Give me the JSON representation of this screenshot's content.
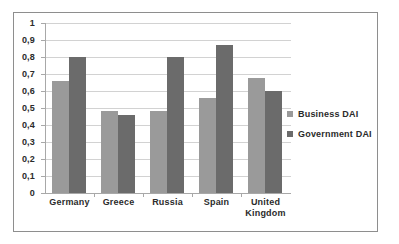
{
  "chart_data": {
    "type": "bar",
    "title": "",
    "subtitle": "",
    "xlabel": "",
    "ylabel": "",
    "categories": [
      "Germany",
      "Greece",
      "Russia",
      "Spain",
      "United Kingdom"
    ],
    "series": [
      {
        "name": "Business DAI",
        "color": "#9a9a9a",
        "values": [
          0.66,
          0.48,
          0.48,
          0.56,
          0.675
        ]
      },
      {
        "name": "Government DAI",
        "color": "#6b6b6b",
        "values": [
          0.8,
          0.46,
          0.8,
          0.87,
          0.6
        ]
      }
    ],
    "ylim": [
      0,
      1
    ],
    "ytick_values": [
      0,
      0.1,
      0.2,
      0.3,
      0.4,
      0.5,
      0.6,
      0.7,
      0.8,
      0.9,
      1
    ],
    "ytick_labels": [
      "0",
      "0,1",
      "0,2",
      "0,3",
      "0,4",
      "0,5",
      "0,6",
      "0,7",
      "0,8",
      "0,9",
      "1"
    ],
    "grid": true,
    "legend_position": "right",
    "decimal_separator": ","
  },
  "legend": {
    "entries": [
      {
        "label": "Business DAI",
        "marker": "legend-swatch-business"
      },
      {
        "label": "Government DAI",
        "marker": "legend-swatch-government"
      }
    ]
  },
  "axis": {
    "y_labels": [
      "1",
      "0,9",
      "0,8",
      "0,7",
      "0,6",
      "0,5",
      "0,4",
      "0,3",
      "0,2",
      "0,1",
      "0"
    ],
    "x_labels": [
      "Germany",
      "Greece",
      "Russia",
      "Spain",
      "United Kingdom"
    ]
  },
  "colors": {
    "business_bar": "#9a9a9a",
    "government_bar": "#6b6b6b",
    "gridline": "#d2d2d2",
    "axis_line": "#a8a8a8",
    "frame_border": "#8e8e8e",
    "text": "#2b2b2b",
    "background": "#ffffff"
  }
}
